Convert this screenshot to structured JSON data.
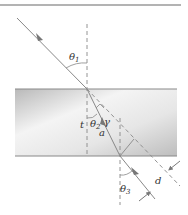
{
  "diagram": {
    "labels": {
      "theta1": "θ",
      "theta1_sub": "1",
      "theta2": "θ",
      "theta2_sub": "2",
      "theta3": "θ",
      "theta3_sub": "3",
      "t": "t",
      "gamma": "γ",
      "a": "a",
      "d": "d"
    },
    "colors": {
      "ray": "#8a8a8a",
      "dashed": "#8a8a8a",
      "slab_dark": "#b5b5b5",
      "slab_light": "#f2f2f2",
      "top_rule": "#9a9a9a",
      "text": "#333333"
    },
    "elements": [
      "incident ray",
      "slab",
      "normal at entry",
      "refracted ray",
      "normal at exit",
      "emergent ray",
      "extension of incident ray",
      "perpendicular displacement d",
      "angle gamma"
    ]
  }
}
